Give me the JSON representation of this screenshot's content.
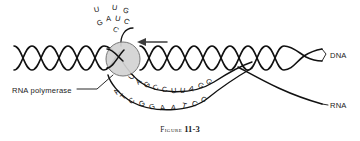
{
  "figure": {
    "caption_word": "Figure",
    "caption_number": "11-3"
  },
  "labels": {
    "dna": "DNA",
    "rna": "RNA",
    "polymerase": "RNA polymerase"
  },
  "colors": {
    "stroke": "#111111",
    "polymerase_fill": "#d2d2d2",
    "polymerase_stroke": "#5a5a5a",
    "arrow": "#3c3c3c",
    "text": "#1a1a1a",
    "background": "#ffffff"
  },
  "sequences": {
    "rna_transcript": "UAGCCUUAGG",
    "dna_template": "ATCGGAATCC",
    "rna_tail": "CUAGUUG",
    "rna_tail_rows": [
      {
        "row": "top",
        "letters": [
          "U",
          "U",
          "G"
        ]
      },
      {
        "row": "middle",
        "letters": [
          "G",
          "A",
          "U",
          "C"
        ]
      },
      {
        "row": "bottom",
        "letters": [
          "C"
        ]
      }
    ]
  },
  "rna_tail_letters": [
    {
      "char": "U",
      "x": 94,
      "y": 6,
      "rot": -12
    },
    {
      "char": "U",
      "x": 112,
      "y": 4,
      "rot": 6
    },
    {
      "char": "G",
      "x": 123,
      "y": 7,
      "rot": 18
    },
    {
      "char": "G",
      "x": 97,
      "y": 19,
      "rot": -22
    },
    {
      "char": "A",
      "x": 106,
      "y": 15,
      "rot": -4
    },
    {
      "char": "U",
      "x": 115,
      "y": 15,
      "rot": 10
    },
    {
      "char": "C",
      "x": 124,
      "y": 18,
      "rot": 26
    },
    {
      "char": "C",
      "x": 113,
      "y": 26,
      "rot": 32
    }
  ],
  "rna_transcript_letters": [
    {
      "char": "U",
      "x": 129,
      "y": 73,
      "rot": -52
    },
    {
      "char": "A",
      "x": 136,
      "y": 78,
      "rot": -42
    },
    {
      "char": "G",
      "x": 144,
      "y": 81,
      "rot": -32
    },
    {
      "char": "C",
      "x": 153,
      "y": 84,
      "rot": -22
    },
    {
      "char": "C",
      "x": 162,
      "y": 86,
      "rot": -12
    },
    {
      "char": "U",
      "x": 171,
      "y": 87,
      "rot": -4
    },
    {
      "char": "U",
      "x": 180,
      "y": 87,
      "rot": 5
    },
    {
      "char": "A",
      "x": 189,
      "y": 85,
      "rot": 15
    },
    {
      "char": "G",
      "x": 198,
      "y": 82,
      "rot": 25
    },
    {
      "char": "G",
      "x": 206,
      "y": 78,
      "rot": 35
    }
  ],
  "dna_template_letters": [
    {
      "char": "A",
      "x": 114,
      "y": 88,
      "rot": -56
    },
    {
      "char": "T",
      "x": 121,
      "y": 93,
      "rot": -46
    },
    {
      "char": "C",
      "x": 129,
      "y": 97,
      "rot": -36
    },
    {
      "char": "G",
      "x": 139,
      "y": 100,
      "rot": -24
    },
    {
      "char": "G",
      "x": 149,
      "y": 103,
      "rot": -14
    },
    {
      "char": "A",
      "x": 160,
      "y": 104,
      "rot": -5
    },
    {
      "char": "A",
      "x": 171,
      "y": 104,
      "rot": 4
    },
    {
      "char": "T",
      "x": 182,
      "y": 102,
      "rot": 14
    },
    {
      "char": "C",
      "x": 192,
      "y": 100,
      "rot": 24
    },
    {
      "char": "C",
      "x": 201,
      "y": 96,
      "rot": 34
    }
  ],
  "diagram": {
    "polymerase_bubble": {
      "cx": 123,
      "cy": 59,
      "r": 17
    },
    "transcription_arrow": {
      "from_x": 167,
      "to_x": 139,
      "y": 42
    }
  }
}
